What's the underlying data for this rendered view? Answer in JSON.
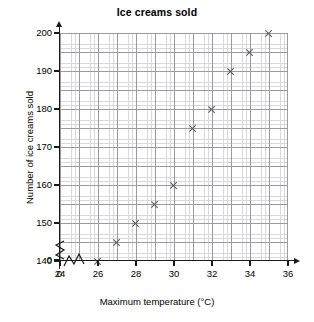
{
  "chart_data": {
    "type": "scatter",
    "title": "Ice creams sold",
    "xlabel": "Maximum temperature (°C)",
    "ylabel": "Number of ice creams sold",
    "x": [
      26,
      27,
      28,
      29,
      30,
      31,
      32,
      33,
      34,
      35
    ],
    "values": [
      140,
      145,
      150,
      155,
      160,
      175,
      180,
      190,
      195,
      200
    ],
    "points": [
      {
        "x": 26,
        "y": 140
      },
      {
        "x": 27,
        "y": 145
      },
      {
        "x": 28,
        "y": 150
      },
      {
        "x": 29,
        "y": 155
      },
      {
        "x": 30,
        "y": 160
      },
      {
        "x": 31,
        "y": 175
      },
      {
        "x": 32,
        "y": 180
      },
      {
        "x": 33,
        "y": 190
      },
      {
        "x": 34,
        "y": 195
      },
      {
        "x": 35,
        "y": 200
      }
    ],
    "xlim": [
      24,
      36
    ],
    "ylim": [
      140,
      200
    ],
    "x_ticks": [
      "0",
      "24",
      "26",
      "28",
      "30",
      "32",
      "34",
      "36"
    ],
    "y_ticks": [
      "0",
      "140",
      "150",
      "160",
      "170",
      "180",
      "190",
      "200"
    ],
    "grid": true,
    "legend": null,
    "axis_break_x": true,
    "axis_break_y": true,
    "marker": "cross-marker",
    "marker_color": "#555560",
    "grid_color_major": "#9a9aa2",
    "grid_color_minor": "#d8d8dd",
    "axis_color": "#1a1a1a"
  }
}
